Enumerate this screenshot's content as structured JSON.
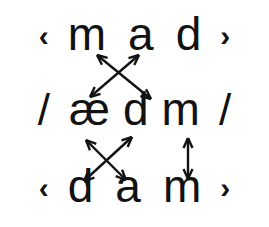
{
  "figure": {
    "background_color": "#ffffff",
    "ink_color": "#121212"
  },
  "rows": {
    "ortho_top": {
      "open_bracket": "‹",
      "letters": [
        "m",
        "a",
        "d"
      ],
      "close_bracket": "›"
    },
    "phonemic": {
      "open_slash": "/",
      "letters": [
        "æ",
        "d",
        "m"
      ],
      "close_slash": "/"
    },
    "ortho_bottom": {
      "open_bracket": "‹",
      "letters": [
        "d",
        "a",
        "m"
      ],
      "close_bracket": "›"
    }
  },
  "arrows": [
    {
      "name": "arrow-a-to-ae",
      "style": "double-headed",
      "from": {
        "x": 139,
        "y": 55
      },
      "to": {
        "x": 90,
        "y": 97
      }
    },
    {
      "name": "arrow-d-to-d-upper",
      "style": "double-headed",
      "from": {
        "x": 97,
        "y": 55
      },
      "to": {
        "x": 151,
        "y": 99
      }
    },
    {
      "name": "arrow-ae-to-d-lower",
      "style": "double-headed",
      "from": {
        "x": 86,
        "y": 140
      },
      "to": {
        "x": 126,
        "y": 180
      }
    },
    {
      "name": "arrow-a-to-d-phonemic",
      "style": "double-headed",
      "from": {
        "x": 84,
        "y": 181
      },
      "to": {
        "x": 132,
        "y": 137
      }
    },
    {
      "name": "arrow-m-to-m-vertical",
      "style": "double-headed",
      "from": {
        "x": 188,
        "y": 138
      },
      "to": {
        "x": 188,
        "y": 179
      }
    }
  ]
}
